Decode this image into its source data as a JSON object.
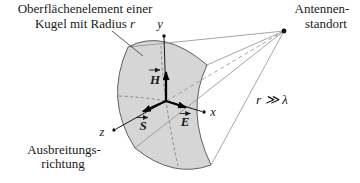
{
  "diagram": {
    "surface_label": {
      "line1": "Oberflächenelement einer",
      "line2_text": "Kugel mit Radius ",
      "line2_symbol": "r"
    },
    "antenna_label": {
      "line1": "Antennen-",
      "line2": "standort"
    },
    "far_field_condition": "r ≫ λ",
    "propagation_label": {
      "line1": "Ausbreitungs-",
      "line2": "richtung"
    },
    "axes": {
      "x": "x",
      "y": "y",
      "z": "z"
    },
    "vectors": {
      "h": "H",
      "e": "E",
      "s": "S"
    },
    "colors": {
      "patch_fill": "#d6d6d6",
      "patch_stroke": "#5f5f5f",
      "sight_line": "#8f8f8f",
      "ink": "#1a1a1a"
    }
  }
}
